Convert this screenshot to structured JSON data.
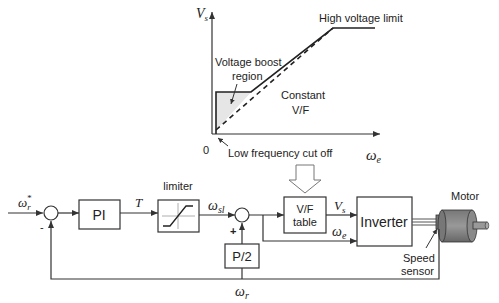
{
  "graph": {
    "y_axis_label": "V",
    "y_axis_sub": "s",
    "x_axis_label": "ω",
    "x_axis_sub": "e",
    "origin_label": "0",
    "annotations": {
      "high_voltage_limit": "High voltage limit",
      "voltage_boost_line1": "Voltage boost",
      "voltage_boost_line2": "region",
      "constant_vf_line1": "Constant",
      "constant_vf_line2": "V/F",
      "low_freq_cutoff": "Low frequency cut off"
    }
  },
  "block_diagram": {
    "input_label": "ω",
    "input_sub": "r",
    "input_sup": "*",
    "minus_sign": "-",
    "plus_sign": "+",
    "pi_block": "PI",
    "torque_label": "T",
    "limiter_title": "limiter",
    "slip_label": "ω",
    "slip_sub": "sl",
    "p2_block": "P/2",
    "vf_table_line1": "V/F",
    "vf_table_line2": "table",
    "vs_label": "V",
    "vs_sub": "s",
    "we_label": "ω",
    "we_sub": "e",
    "inverter_block": "Inverter",
    "motor_label": "Motor",
    "speed_sensor_line1": "Speed",
    "speed_sensor_line2": "sensor",
    "feedback_label": "ω",
    "feedback_sub": "r"
  }
}
